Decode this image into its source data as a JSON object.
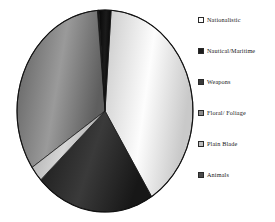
{
  "chart_data": {
    "type": "pie",
    "title": "",
    "subtitle": "",
    "xlabel": "",
    "ylabel": "",
    "grid": false,
    "legend_position": "right",
    "start_angle_deg": 0,
    "direction": "clockwise",
    "categories": [
      "Nationalistic",
      "Nautical/Maritime",
      "Weapons",
      "Floral/ Foliage",
      "Plain Blade",
      "Animals"
    ],
    "values": [
      40.0,
      2.0,
      22.0,
      33.0,
      2.0,
      1.0
    ],
    "slices": [
      {
        "label": "Nationalistic",
        "value": 40.0,
        "start_deg": 4.0,
        "end_deg": 148.0,
        "fill": "#fdfdfd",
        "fill_dark": "#c9c9c9",
        "swatch": "#fdfdfd"
      },
      {
        "label": "Nautical/Maritime",
        "value": 2.0,
        "start_deg": 356.0,
        "end_deg": 4.0,
        "fill": "#1b1b1b",
        "fill_dark": "#070707",
        "swatch": "#1d1d1d"
      },
      {
        "label": "Weapons",
        "value": 22.0,
        "start_deg": 148.0,
        "end_deg": 227.0,
        "fill": "#3a3a3a",
        "fill_dark": "#171717",
        "swatch": "#3a3a3a"
      },
      {
        "label": "Floral/ Foliage",
        "value": 33.0,
        "start_deg": 236.0,
        "end_deg": 356.0,
        "fill": "#9a9a9a",
        "fill_dark": "#5e5e5e",
        "swatch": "#8c8c8c"
      },
      {
        "label": "Plain Blade",
        "value": 2.0,
        "start_deg": 227.0,
        "end_deg": 236.0,
        "fill": "#d6d6d6",
        "fill_dark": "#a6a6a6",
        "swatch": "#bdbdbd"
      },
      {
        "label": "Animals",
        "value": 1.0,
        "start_deg": 355.0,
        "end_deg": 356.0,
        "fill": "#2e2e2e",
        "fill_dark": "#121212",
        "swatch": "#4a4a4a"
      }
    ]
  },
  "legend": {
    "items": [
      {
        "label": "Nationalistic",
        "swatch": "#fdfdfd"
      },
      {
        "label": "Nautical/Maritime",
        "swatch": "#1d1d1d"
      },
      {
        "label": "Weapons",
        "swatch": "#3a3a3a"
      },
      {
        "label": "Floral/ Foliage",
        "swatch": "#8c8c8c"
      },
      {
        "label": "Plain Blade",
        "swatch": "#bdbdbd"
      },
      {
        "label": "Animals",
        "swatch": "#4a4a4a"
      }
    ]
  },
  "style": {
    "background": "#ffffff",
    "outline": "#111111",
    "text_color": "#161616"
  }
}
